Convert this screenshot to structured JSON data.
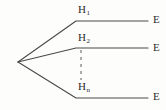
{
  "diagram": {
    "type": "fan-branch-tree",
    "background_color": "#fdfdfc",
    "line_color": "#4a4a4a",
    "text_color": "#2b2b2b",
    "vertex": {
      "x": 18,
      "y": 62
    },
    "branches": [
      {
        "name": "branch-1",
        "node_label_base": "H",
        "node_label_sub": "1",
        "end_label": "E",
        "elbow": {
          "x": 76,
          "y": 21
        },
        "line_end": {
          "x": 148,
          "y": 21
        }
      },
      {
        "name": "branch-2",
        "node_label_base": "H",
        "node_label_sub": "2",
        "end_label": "E",
        "elbow": {
          "x": 76,
          "y": 48
        },
        "line_end": {
          "x": 148,
          "y": 48
        }
      },
      {
        "name": "branch-n",
        "node_label_base": "H",
        "node_label_sub": "n",
        "end_label": "E",
        "elbow": {
          "x": 76,
          "y": 98
        },
        "line_end": {
          "x": 148,
          "y": 98
        }
      }
    ],
    "ellipsis_connector": {
      "name": "vertical-dashed-ellipsis",
      "x": 81,
      "y_start": 50,
      "y_end": 80,
      "style": "dashed"
    }
  },
  "labels": {
    "h1": {
      "base": "H",
      "sub": "1"
    },
    "h2": {
      "base": "H",
      "sub": "2"
    },
    "hn": {
      "base": "H",
      "sub": "n"
    },
    "e1": "E",
    "e2": "E",
    "e3": "E"
  }
}
